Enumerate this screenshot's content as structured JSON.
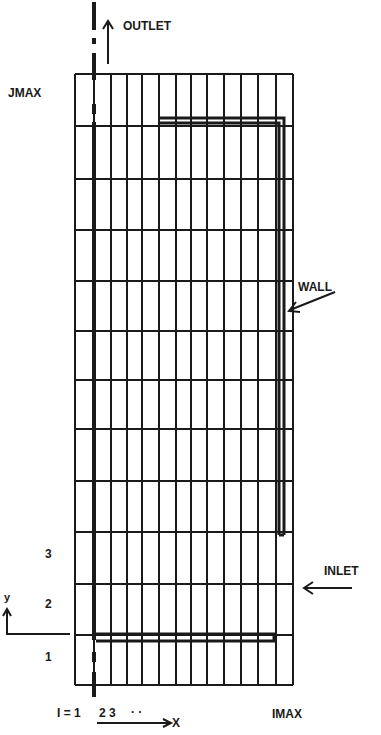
{
  "labels": {
    "outlet": "OUTLET",
    "jmax": "JMAX",
    "wall": "WALL",
    "inlet": "INLET",
    "imax": "IMAX",
    "y_axis": "y",
    "x_axis": "X",
    "i_index": "I = 1",
    "i_next": "2 3",
    "i_dots": "· ·",
    "j_rows": [
      "3",
      "2",
      "1"
    ]
  },
  "grid": {
    "x_lines": [
      75,
      94,
      111,
      127,
      142,
      159,
      176,
      191,
      207,
      224,
      241,
      258,
      276,
      293
    ],
    "y_lines": [
      74,
      126,
      179,
      230,
      281,
      331,
      380,
      429,
      481,
      532,
      584,
      635,
      685
    ],
    "line_color": "#1a1a1a"
  },
  "colors": {
    "ink": "#1a1a1a",
    "background": "#ffffff"
  }
}
